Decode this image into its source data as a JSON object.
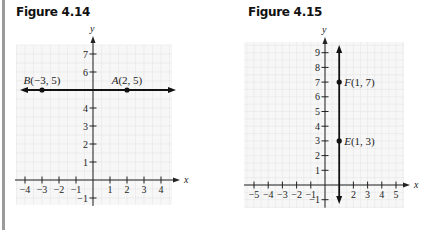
{
  "figures": [
    {
      "title": "Figure 4.14",
      "chart_data": {
        "type": "line",
        "title": "Figure 4.14",
        "xlabel": "x",
        "ylabel": "y",
        "xlim": [
          -4,
          4
        ],
        "ylim": [
          -1,
          7
        ],
        "x_ticks": [
          -4,
          -3,
          -2,
          -1,
          1,
          2,
          3,
          4
        ],
        "y_ticks": [
          -1,
          1,
          2,
          3,
          4,
          6,
          7
        ],
        "grid": true,
        "line": {
          "kind": "horizontal",
          "equation": "y = 5",
          "arrows": "both"
        },
        "points": [
          {
            "name": "B",
            "x": -3,
            "y": 5,
            "label": "B(−3, 5)"
          },
          {
            "name": "A",
            "x": 2,
            "y": 5,
            "label": "A(2, 5)"
          }
        ]
      }
    },
    {
      "title": "Figure 4.15",
      "chart_data": {
        "type": "line",
        "title": "Figure 4.15",
        "xlabel": "x",
        "ylabel": "y",
        "xlim": [
          -5,
          5
        ],
        "ylim": [
          -1,
          9
        ],
        "x_ticks": [
          -5,
          -4,
          -3,
          -2,
          -1,
          2,
          3,
          4,
          5
        ],
        "y_ticks": [
          -1,
          1,
          2,
          3,
          4,
          5,
          6,
          7,
          8,
          9
        ],
        "grid": true,
        "line": {
          "kind": "vertical",
          "equation": "x = 1",
          "arrows": "both"
        },
        "points": [
          {
            "name": "F",
            "x": 1,
            "y": 7,
            "label": "F(1, 7)"
          },
          {
            "name": "E",
            "x": 1,
            "y": 3,
            "label": "E(1, 3)"
          }
        ]
      }
    }
  ]
}
